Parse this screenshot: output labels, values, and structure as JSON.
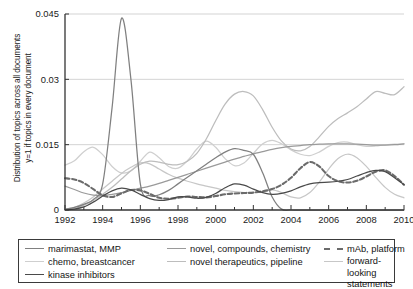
{
  "axes": {
    "ylabel_line1": "Distribution of topics across all documents",
    "ylabel_line2": "y=1 if topics in every document",
    "yticks": [
      "0",
      "0.015",
      "0.03",
      "0.045"
    ],
    "xticks": [
      "1992",
      "1994",
      "1996",
      "1998",
      "2000",
      "2002",
      "2004",
      "2006",
      "2008",
      "2010"
    ]
  },
  "legend": {
    "items": [
      {
        "label": "marimastat, MMP",
        "color": "#808080",
        "dash": false
      },
      {
        "label": "chemo, breastcancer",
        "color": "#cfcfcf",
        "dash": false
      },
      {
        "label": "kinase inhibitors",
        "color": "#4a4a4a",
        "dash": false
      },
      {
        "label": "novel, compounds, chemistry",
        "color": "#9a9a9a",
        "dash": false
      },
      {
        "label": "novel therapeutics, pipeline",
        "color": "#bdbdbd",
        "dash": false
      },
      {
        "label": "mAb, platform",
        "color": "#6b6b6b",
        "dash": true
      },
      {
        "label": "forward-looking statements",
        "color": "#c7c7c7",
        "dash": false
      }
    ]
  },
  "chart_data": {
    "type": "line",
    "title": "",
    "xlabel": "",
    "ylabel": "Distribution of topics across all documents y=1 if topics in every document",
    "xlim": [
      1992,
      2010
    ],
    "ylim": [
      0,
      0.045
    ],
    "yticks": [
      0,
      0.015,
      0.03,
      0.045
    ],
    "xticks": [
      1992,
      1994,
      1996,
      1998,
      2000,
      2002,
      2004,
      2006,
      2008,
      2010
    ],
    "grid": "horizontal",
    "legend_position": "below",
    "x": [
      1992,
      1992.5,
      1993,
      1993.5,
      1994,
      1994.5,
      1995,
      1995.5,
      1996,
      1996.5,
      1997,
      1997.5,
      1998,
      1998.5,
      1999,
      1999.5,
      2000,
      2000.5,
      2001,
      2001.5,
      2002,
      2002.5,
      2003,
      2003.5,
      2004,
      2004.5,
      2005,
      2005.5,
      2006,
      2006.5,
      2007,
      2007.5,
      2008,
      2008.5,
      2009,
      2009.5,
      2010
    ],
    "series": [
      {
        "name": "marimastat, MMP",
        "color": "#808080",
        "dash": false,
        "values": [
          0.0002,
          0.0006,
          0.0013,
          0.0024,
          0.006,
          0.0235,
          0.044,
          0.03,
          0.006,
          0.0033,
          0.0035,
          0.0045,
          0.006,
          0.0075,
          0.009,
          0.0105,
          0.012,
          0.0133,
          0.0141,
          0.0137,
          0.0128,
          0.0085,
          0.003,
          0.0002,
          0.0,
          0.0,
          0.0,
          0.0,
          0.0,
          0.0,
          0.0,
          0.0,
          0.0,
          0.0,
          0.0,
          0.0,
          0.0
        ]
      },
      {
        "name": "chemo, breastcancer",
        "color": "#cfcfcf",
        "dash": false,
        "values": [
          0.0103,
          0.0113,
          0.0134,
          0.0144,
          0.0127,
          0.01,
          0.0085,
          0.009,
          0.0112,
          0.0133,
          0.012,
          0.01,
          0.0096,
          0.0113,
          0.014,
          0.0158,
          0.0144,
          0.0118,
          0.0102,
          0.0108,
          0.013,
          0.0152,
          0.016,
          0.0152,
          0.0138,
          0.0128,
          0.0125,
          0.0133,
          0.0146,
          0.0155,
          0.0156,
          0.015,
          0.0146,
          0.0147,
          0.015,
          0.0151,
          0.0152
        ]
      },
      {
        "name": "kinase inhibitors",
        "color": "#4a4a4a",
        "dash": false,
        "values": [
          0.0,
          0.0002,
          0.0007,
          0.0018,
          0.0032,
          0.0044,
          0.005,
          0.0046,
          0.0036,
          0.0026,
          0.0022,
          0.0024,
          0.003,
          0.003,
          0.0027,
          0.0029,
          0.0038,
          0.0051,
          0.006,
          0.0057,
          0.0048,
          0.004,
          0.0036,
          0.0038,
          0.0044,
          0.0053,
          0.006,
          0.0063,
          0.0064,
          0.0066,
          0.007,
          0.0078,
          0.0086,
          0.0091,
          0.0088,
          0.0074,
          0.0058
        ]
      },
      {
        "name": "novel, compounds, chemistry",
        "color": "#9a9a9a",
        "dash": false,
        "values": [
          0.0055,
          0.0047,
          0.0039,
          0.0034,
          0.0033,
          0.0036,
          0.004,
          0.0045,
          0.005,
          0.0055,
          0.0061,
          0.0068,
          0.0075,
          0.0082,
          0.0089,
          0.0096,
          0.0103,
          0.011,
          0.0117,
          0.0123,
          0.0129,
          0.0134,
          0.0139,
          0.0143,
          0.0146,
          0.0148,
          0.015,
          0.0151,
          0.0152,
          0.0152,
          0.0152,
          0.0151,
          0.015,
          0.0149,
          0.0149,
          0.015,
          0.0152
        ]
      },
      {
        "name": "novel therapeutics, pipeline",
        "color": "#bdbdbd",
        "dash": false,
        "values": [
          0.0,
          0.0003,
          0.0011,
          0.0022,
          0.0036,
          0.0052,
          0.0071,
          0.009,
          0.0105,
          0.0112,
          0.011,
          0.0105,
          0.0104,
          0.0112,
          0.013,
          0.0163,
          0.0205,
          0.0243,
          0.0266,
          0.0272,
          0.0262,
          0.023,
          0.019,
          0.0158,
          0.014,
          0.0136,
          0.0146,
          0.0168,
          0.0192,
          0.021,
          0.0223,
          0.0237,
          0.0255,
          0.0272,
          0.0268,
          0.0265,
          0.0283
        ]
      },
      {
        "name": "mAb, platform",
        "color": "#6b6b6b",
        "dash": true,
        "values": [
          0.0073,
          0.007,
          0.0062,
          0.0048,
          0.0034,
          0.003,
          0.0038,
          0.0046,
          0.0045,
          0.0037,
          0.0028,
          0.0026,
          0.0028,
          0.0031,
          0.003,
          0.0029,
          0.0032,
          0.0036,
          0.0038,
          0.0039,
          0.004,
          0.0043,
          0.0048,
          0.0058,
          0.0074,
          0.0096,
          0.011,
          0.01,
          0.0078,
          0.0066,
          0.0063,
          0.0067,
          0.0077,
          0.0088,
          0.0091,
          0.0078,
          0.0058
        ]
      },
      {
        "name": "forward-looking statements",
        "color": "#c7c7c7",
        "dash": false,
        "values": [
          0.0002,
          0.0006,
          0.0016,
          0.003,
          0.0048,
          0.0066,
          0.0084,
          0.0098,
          0.0108,
          0.0106,
          0.0094,
          0.0082,
          0.0073,
          0.0066,
          0.006,
          0.0055,
          0.005,
          0.0045,
          0.0042,
          0.004,
          0.004,
          0.0042,
          0.0046,
          0.004,
          0.003,
          0.0028,
          0.004,
          0.0064,
          0.0094,
          0.0118,
          0.0128,
          0.012,
          0.01,
          0.0075,
          0.0052,
          0.0036,
          0.0028
        ]
      }
    ]
  }
}
